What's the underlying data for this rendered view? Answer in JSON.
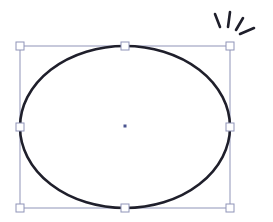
{
  "canvas": {
    "width": 273,
    "height": 222,
    "background": "#ffffff"
  },
  "shape": {
    "type": "ellipse",
    "cx": 125,
    "cy": 127,
    "rx": 105,
    "ry": 81,
    "stroke": "#1f1f2b",
    "stroke_width": 2.6,
    "fill": "none"
  },
  "selection": {
    "bbox": {
      "x": 20,
      "y": 46,
      "width": 210,
      "height": 162
    },
    "stroke": "#8f94b8",
    "handle_size": 8,
    "handle_fill": "#ffffff",
    "handle_stroke": "#8f94b8",
    "handles": [
      {
        "name": "handle-top-left",
        "x": 20,
        "y": 46
      },
      {
        "name": "handle-top-center",
        "x": 125,
        "y": 46
      },
      {
        "name": "handle-top-right",
        "x": 230,
        "y": 46
      },
      {
        "name": "handle-middle-left",
        "x": 20,
        "y": 127
      },
      {
        "name": "handle-middle-right",
        "x": 230,
        "y": 127
      },
      {
        "name": "handle-bottom-left",
        "x": 20,
        "y": 208
      },
      {
        "name": "handle-bottom-center",
        "x": 125,
        "y": 208
      },
      {
        "name": "handle-bottom-right",
        "x": 230,
        "y": 208
      }
    ],
    "center_point": {
      "x": 125,
      "y": 126,
      "color": "#4a5490"
    }
  },
  "spark": {
    "icon": "highlight-spark-icon",
    "color": "#1f1f2b",
    "lines": [
      {
        "x1": 215,
        "y1": 14,
        "x2": 220,
        "y2": 27
      },
      {
        "x1": 230,
        "y1": 12,
        "x2": 228,
        "y2": 27
      },
      {
        "x1": 243,
        "y1": 18,
        "x2": 236,
        "y2": 30
      },
      {
        "x1": 254,
        "y1": 28,
        "x2": 240,
        "y2": 34
      }
    ]
  }
}
